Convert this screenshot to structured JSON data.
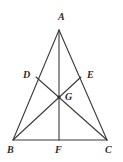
{
  "figure": {
    "type": "geometry-diagram",
    "background_color": "#ffffff",
    "line_color": "#3a3a3a",
    "label_color": "#2b2b2b",
    "line_width": 1.1,
    "width": 123,
    "height": 162,
    "points": {
      "A": {
        "label": "A",
        "x": 59,
        "y": 30,
        "label_x": 58,
        "label_y": 12
      },
      "B": {
        "label": "B",
        "x": 13,
        "y": 140,
        "label_x": 7,
        "label_y": 145
      },
      "C": {
        "label": "C",
        "x": 107,
        "y": 140,
        "label_x": 105,
        "label_y": 145
      },
      "D": {
        "label": "D",
        "x": 36,
        "y": 77,
        "label_x": 23,
        "label_y": 70
      },
      "E": {
        "label": "E",
        "x": 81,
        "y": 77,
        "label_x": 87,
        "label_y": 70
      },
      "F": {
        "label": "F",
        "x": 59,
        "y": 140,
        "label_x": 55,
        "label_y": 145
      },
      "G": {
        "label": "G",
        "x": 59,
        "y": 97,
        "label_x": 65,
        "label_y": 92
      }
    },
    "segments": [
      {
        "name": "side-AB",
        "from": "A",
        "to": "B"
      },
      {
        "name": "side-AC",
        "from": "A",
        "to": "C"
      },
      {
        "name": "side-BC",
        "from": "B",
        "to": "C"
      },
      {
        "name": "median-AF",
        "from": "A",
        "to": "F"
      },
      {
        "name": "median-BE",
        "from": "B",
        "to": "E"
      },
      {
        "name": "median-CD",
        "from": "C",
        "to": "D"
      }
    ],
    "markers": [
      {
        "name": "centroid-dot",
        "at": "G",
        "radius": 1.6
      }
    ]
  }
}
